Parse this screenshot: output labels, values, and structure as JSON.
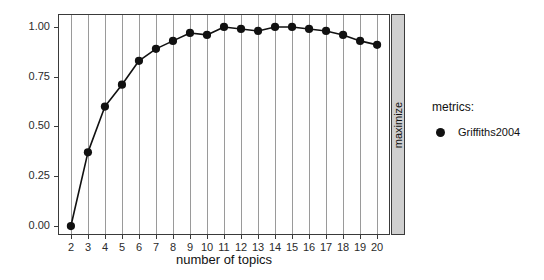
{
  "chart_data": {
    "type": "line",
    "title": "",
    "subtitle": "",
    "xlabel": "number of topics",
    "ylabel": "",
    "strip_label": "maximize",
    "x": [
      2,
      3,
      4,
      5,
      6,
      7,
      8,
      9,
      10,
      11,
      12,
      13,
      14,
      15,
      16,
      17,
      18,
      19,
      20
    ],
    "xtick_labels": [
      "2",
      "3",
      "4",
      "5",
      "6",
      "7",
      "8",
      "9",
      "10",
      "11",
      "12",
      "13",
      "14",
      "15",
      "16",
      "17",
      "18",
      "19",
      "20"
    ],
    "ytick_labels": [
      "0.00",
      "0.25",
      "0.50",
      "0.75",
      "1.00"
    ],
    "ytick_values": [
      0.0,
      0.25,
      0.5,
      0.75,
      1.0
    ],
    "ylim": [
      -0.04,
      1.06
    ],
    "xlim": [
      1.3,
      20.7
    ],
    "grid": "vertical-major",
    "legend_position": "right",
    "series": [
      {
        "name": "Griffiths2004",
        "marker": "circle",
        "color": "#111111",
        "values": [
          0.0,
          0.37,
          0.6,
          0.71,
          0.83,
          0.89,
          0.93,
          0.97,
          0.96,
          1.0,
          0.99,
          0.98,
          1.0,
          1.0,
          0.99,
          0.98,
          0.96,
          0.93,
          0.91
        ]
      }
    ]
  },
  "legend": {
    "title": "metrics:",
    "entries": [
      {
        "label": "Griffiths2004",
        "marker": "circle-icon",
        "color": "#111111"
      }
    ]
  },
  "colors": {
    "line": "#111111",
    "marker": "#111111",
    "gridline": "#9a9a9a",
    "panel_border": "#3a3a3a",
    "strip_fill": "#cfcfcf",
    "text": "#111111",
    "background": "#ffffff"
  }
}
